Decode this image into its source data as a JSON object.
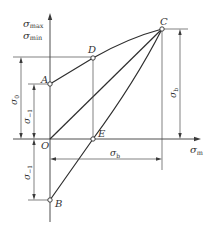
{
  "diagram": {
    "type": "Smith fatigue limit diagram (limiting stress diagram)",
    "axes": {
      "y_label_main": "σ",
      "y_label_sub1": "max",
      "y_label_sub2": "min",
      "x_label_main": "σ",
      "x_label_sub": "m"
    },
    "points": {
      "A": "A",
      "B": "B",
      "C": "C",
      "D": "D",
      "E": "E",
      "O": "O"
    },
    "dimensions": {
      "sigma0_main": "σ",
      "sigma0_sub": "0",
      "sigma_neg1_main": "σ",
      "sigma_neg1_sub": "−1",
      "sigma_neg1_lower_main": "σ",
      "sigma_neg1_lower_sub": "−1",
      "sigmab_horizontal_main": "σ",
      "sigmab_horizontal_sub": "b",
      "sigmab_vertical_main": "σ",
      "sigmab_vertical_sub": "b"
    },
    "colors": {
      "line": "#3a3a3a",
      "background": "#ffffff"
    }
  }
}
